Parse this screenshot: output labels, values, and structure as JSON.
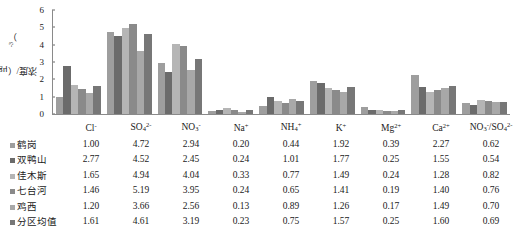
{
  "chart_data": {
    "type": "bar",
    "title": "",
    "xlabel": "",
    "ylabel": "浓度/（μg·m-3）",
    "ylim": [
      0,
      6
    ],
    "yticks": [
      0,
      1,
      2,
      3,
      4,
      5,
      6
    ],
    "grid": false,
    "legend_position": "left-table",
    "categories": [
      "Cl-",
      "SO42-",
      "NO3-",
      "Na+",
      "NH4+",
      "K+",
      "Mg2+",
      "Ca2+",
      "NO3-/SO42-"
    ],
    "series": [
      {
        "name": "鹤岗",
        "color": "#9e9e9e",
        "values": [
          1.0,
          4.72,
          2.94,
          0.2,
          0.44,
          1.92,
          0.39,
          2.27,
          0.62
        ]
      },
      {
        "name": "双鸭山",
        "color": "#6b6b6b",
        "values": [
          2.77,
          4.52,
          2.45,
          0.24,
          1.01,
          1.77,
          0.25,
          1.55,
          0.54
        ]
      },
      {
        "name": "佳木斯",
        "color": "#b5b5b5",
        "values": [
          1.65,
          4.94,
          4.04,
          0.33,
          0.77,
          1.49,
          0.24,
          1.28,
          0.82
        ]
      },
      {
        "name": "七台河",
        "color": "#8a8a8a",
        "values": [
          1.46,
          5.19,
          3.95,
          0.24,
          0.65,
          1.41,
          0.19,
          1.4,
          0.76
        ]
      },
      {
        "name": "鸡西",
        "color": "#a8a8a8",
        "values": [
          1.2,
          3.66,
          2.56,
          0.13,
          0.89,
          1.26,
          0.17,
          1.49,
          0.7
        ]
      },
      {
        "name": "分区均值",
        "color": "#777777",
        "values": [
          1.61,
          4.61,
          3.19,
          0.23,
          0.75,
          1.57,
          0.25,
          1.6,
          0.69
        ]
      }
    ]
  },
  "axis": {
    "ylabel_main": "浓度/（μg·m",
    "ylabel_sup": "-3",
    "ylabel_tail": "）",
    "ytick_labels": [
      "6",
      "5",
      "4",
      "3",
      "2",
      "1",
      "0"
    ]
  },
  "table": {
    "corner_label": "",
    "columns": [
      {
        "base": "Cl",
        "sup": "-",
        "sub": ""
      },
      {
        "base": "SO",
        "sup": "2-",
        "sub": "4"
      },
      {
        "base": "NO",
        "sup": "-",
        "sub": "3"
      },
      {
        "base": "Na",
        "sup": "+",
        "sub": ""
      },
      {
        "base": "NH",
        "sup": "+",
        "sub": "4"
      },
      {
        "base": "K",
        "sup": "+",
        "sub": ""
      },
      {
        "base": "Mg",
        "sup": "2+",
        "sub": ""
      },
      {
        "base": "Ca",
        "sup": "2+",
        "sub": ""
      },
      {
        "base": "NO3-/SO42-",
        "sup": "",
        "sub": ""
      }
    ],
    "column_labels_plain": [
      "Cl⁻",
      "SO₄²⁻",
      "NO₃⁻",
      "Na⁺",
      "NH₄⁺",
      "K⁺",
      "Mg²⁺",
      "Ca²⁺",
      "NO₃⁻/SO₄²⁻"
    ],
    "rows": [
      {
        "label": "鹤岗",
        "color": "#9e9e9e",
        "values": [
          "1.00",
          "4.72",
          "2.94",
          "0.20",
          "0.44",
          "1.92",
          "0.39",
          "2.27",
          "0.62"
        ]
      },
      {
        "label": "双鸭山",
        "color": "#6b6b6b",
        "values": [
          "2.77",
          "4.52",
          "2.45",
          "0.24",
          "1.01",
          "1.77",
          "0.25",
          "1.55",
          "0.54"
        ]
      },
      {
        "label": "佳木斯",
        "color": "#b5b5b5",
        "values": [
          "1.65",
          "4.94",
          "4.04",
          "0.33",
          "0.77",
          "1.49",
          "0.24",
          "1.28",
          "0.82"
        ]
      },
      {
        "label": "七台河",
        "color": "#8a8a8a",
        "values": [
          "1.46",
          "5.19",
          "3.95",
          "0.24",
          "0.65",
          "1.41",
          "0.19",
          "1.40",
          "0.76"
        ]
      },
      {
        "label": "鸡西",
        "color": "#a8a8a8",
        "values": [
          "1.20",
          "3.66",
          "2.56",
          "0.13",
          "0.89",
          "1.26",
          "0.17",
          "1.49",
          "0.70"
        ]
      },
      {
        "label": "分区均值",
        "color": "#777777",
        "values": [
          "1.61",
          "4.61",
          "3.19",
          "0.23",
          "0.75",
          "1.57",
          "0.25",
          "1.60",
          "0.69"
        ]
      }
    ]
  }
}
